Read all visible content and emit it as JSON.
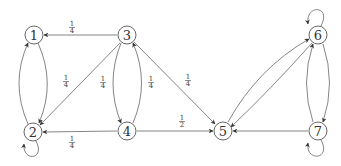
{
  "diagram": {
    "type": "directed-graph",
    "nodes": [
      {
        "id": "1",
        "label": "1",
        "x": 34,
        "y": 34
      },
      {
        "id": "2",
        "label": "2",
        "x": 33,
        "y": 132
      },
      {
        "id": "3",
        "label": "3",
        "x": 127,
        "y": 35
      },
      {
        "id": "4",
        "label": "4",
        "x": 127,
        "y": 131
      },
      {
        "id": "5",
        "label": "5",
        "x": 223,
        "y": 131
      },
      {
        "id": "6",
        "label": "6",
        "x": 318,
        "y": 35
      },
      {
        "id": "7",
        "label": "7",
        "x": 318,
        "y": 131
      }
    ],
    "edges": [
      {
        "from": "3",
        "to": "1",
        "label_num": "1",
        "label_den": "4"
      },
      {
        "from": "3",
        "to": "2",
        "label_num": "1",
        "label_den": "4"
      },
      {
        "from": "3",
        "to": "4",
        "label_num": "1",
        "label_den": "4"
      },
      {
        "from": "4",
        "to": "3",
        "label_num": "1",
        "label_den": "4"
      },
      {
        "from": "3",
        "to": "5",
        "label_num": "1",
        "label_den": "4"
      },
      {
        "from": "4",
        "to": "2",
        "label_num": "1",
        "label_den": "4"
      },
      {
        "from": "4",
        "to": "5",
        "label_num": "1",
        "label_den": "2"
      },
      {
        "from": "1",
        "to": "2",
        "label_num": "",
        "label_den": ""
      },
      {
        "from": "2",
        "to": "1",
        "label_num": "",
        "label_den": ""
      },
      {
        "from": "2",
        "to": "2",
        "label_num": "",
        "label_den": ""
      },
      {
        "from": "5",
        "to": "6",
        "label_num": "",
        "label_den": ""
      },
      {
        "from": "6",
        "to": "5",
        "label_num": "",
        "label_den": ""
      },
      {
        "from": "6",
        "to": "7",
        "label_num": "",
        "label_den": ""
      },
      {
        "from": "7",
        "to": "6",
        "label_num": "",
        "label_den": ""
      },
      {
        "from": "7",
        "to": "5",
        "label_num": "",
        "label_den": ""
      },
      {
        "from": "6",
        "to": "6",
        "label_num": "",
        "label_den": ""
      },
      {
        "from": "7",
        "to": "7",
        "label_num": "",
        "label_den": ""
      }
    ]
  }
}
